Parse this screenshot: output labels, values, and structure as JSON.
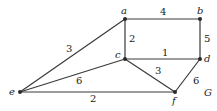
{
  "graph": {
    "name": "G",
    "nodes": [
      {
        "id": "a",
        "label": "a",
        "x": 125,
        "y": 19
      },
      {
        "id": "b",
        "label": "b",
        "x": 200,
        "y": 19
      },
      {
        "id": "c",
        "label": "c",
        "x": 125,
        "y": 59
      },
      {
        "id": "d",
        "label": "d",
        "x": 200,
        "y": 59
      },
      {
        "id": "e",
        "label": "e",
        "x": 20,
        "y": 92
      },
      {
        "id": "f",
        "label": "f",
        "x": 175,
        "y": 92
      }
    ],
    "edges": [
      {
        "from": "a",
        "to": "b",
        "weight": "4"
      },
      {
        "from": "b",
        "to": "d",
        "weight": "5"
      },
      {
        "from": "a",
        "to": "c",
        "weight": "2"
      },
      {
        "from": "c",
        "to": "d",
        "weight": "1"
      },
      {
        "from": "a",
        "to": "e",
        "weight": "3"
      },
      {
        "from": "c",
        "to": "e",
        "weight": "6"
      },
      {
        "from": "c",
        "to": "f",
        "weight": "3"
      },
      {
        "from": "d",
        "to": "f",
        "weight": "6"
      },
      {
        "from": "e",
        "to": "f",
        "weight": "2"
      }
    ]
  }
}
